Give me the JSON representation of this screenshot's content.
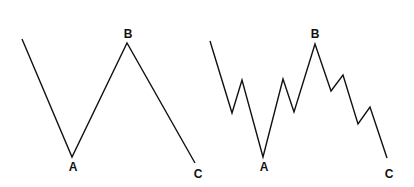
{
  "diagrams": [
    {
      "name": "simple-abc",
      "points": [
        [
          22,
          39
        ],
        [
          72,
          157
        ],
        [
          127,
          43
        ],
        [
          195,
          163
        ]
      ],
      "labels": [
        {
          "text": "A",
          "x": 73,
          "y": 171
        },
        {
          "text": "B",
          "x": 128,
          "y": 38
        },
        {
          "text": "C",
          "x": 198,
          "y": 178
        }
      ]
    },
    {
      "name": "detailed-abc",
      "points": [
        [
          210,
          41
        ],
        [
          232,
          113
        ],
        [
          242,
          80
        ],
        [
          263,
          157
        ],
        [
          283,
          79
        ],
        [
          294,
          112
        ],
        [
          315,
          44
        ],
        [
          331,
          91
        ],
        [
          343,
          75
        ],
        [
          358,
          124
        ],
        [
          370,
          107
        ],
        [
          387,
          158
        ]
      ],
      "labels": [
        {
          "text": "A",
          "x": 264,
          "y": 171
        },
        {
          "text": "B",
          "x": 315,
          "y": 38
        },
        {
          "text": "C",
          "x": 389,
          "y": 178
        }
      ]
    }
  ],
  "colors": {
    "line": "#111111",
    "background": "#ffffff"
  }
}
